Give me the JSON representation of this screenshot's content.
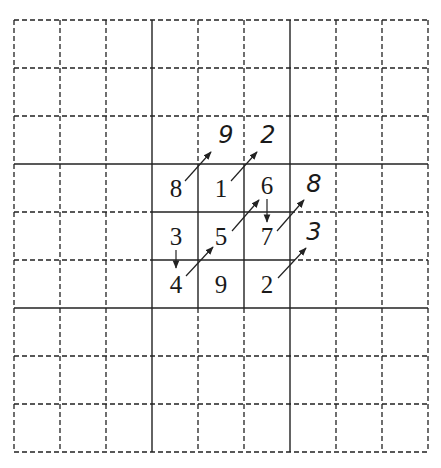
{
  "diagram": {
    "title": "",
    "grid": {
      "rows": 9,
      "cols": 9,
      "origin_x": 14,
      "origin_y": 20,
      "cell_w": 46,
      "cell_h": 48,
      "block_lines": [
        3,
        6
      ],
      "highlight_block": {
        "row_start": 3,
        "col_start": 3,
        "size": 3
      }
    },
    "cells": [
      {
        "row": 3,
        "col": 3,
        "value": "8"
      },
      {
        "row": 3,
        "col": 4,
        "value": "1"
      },
      {
        "row": 3,
        "col": 5,
        "value": "6"
      },
      {
        "row": 4,
        "col": 3,
        "value": "3"
      },
      {
        "row": 4,
        "col": 4,
        "value": "5"
      },
      {
        "row": 4,
        "col": 5,
        "value": "7"
      },
      {
        "row": 5,
        "col": 3,
        "value": "4"
      },
      {
        "row": 5,
        "col": 4,
        "value": "9"
      },
      {
        "row": 5,
        "col": 5,
        "value": "2"
      }
    ],
    "outer_labels": [
      {
        "label": "9",
        "near": "above 1"
      },
      {
        "label": "2",
        "near": "above 6"
      },
      {
        "label": "8",
        "near": "right of 6"
      },
      {
        "label": "3",
        "near": "right of 7"
      }
    ],
    "arrows": [
      {
        "from": "8",
        "to": "9",
        "direction": "up-right"
      },
      {
        "from": "1",
        "to": "2",
        "direction": "up-right"
      },
      {
        "from": "6",
        "to": "7",
        "direction": "down"
      },
      {
        "from": "5",
        "to": "6",
        "direction": "up-right"
      },
      {
        "from": "7",
        "to": "8",
        "direction": "up-right"
      },
      {
        "from": "3",
        "to": "4",
        "direction": "down"
      },
      {
        "from": "4",
        "to": "5",
        "direction": "up-right"
      },
      {
        "from": "2",
        "to": "3",
        "direction": "up-right"
      }
    ]
  }
}
